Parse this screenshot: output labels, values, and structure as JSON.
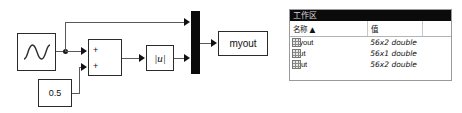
{
  "model": {
    "blocks": {
      "sine": {
        "name": "sine-wave-block",
        "label": ""
      },
      "sum": {
        "sign_top": "+",
        "sign_bottom": "+"
      },
      "abs": {
        "label": "|u|"
      },
      "constant": {
        "label": "0.5"
      },
      "mux": {
        "label": ""
      },
      "to_workspace": {
        "label": "myout"
      }
    }
  },
  "workspace": {
    "title": "工作区",
    "columns": [
      "名称 ▲",
      "值",
      ""
    ],
    "rows": [
      {
        "name": "myout",
        "value": "56x2 double"
      },
      {
        "name": "tout",
        "value": "56x1 double"
      },
      {
        "name": "yout",
        "value": "56x2 double"
      }
    ]
  }
}
